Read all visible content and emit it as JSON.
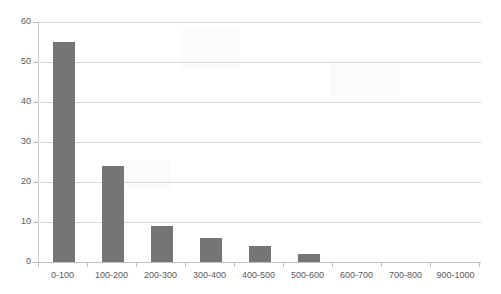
{
  "chart_data": {
    "type": "bar",
    "title": "",
    "subtitle": "",
    "xlabel": "",
    "ylabel": "",
    "categories": [
      "0-100",
      "100-200",
      "200-300",
      "300-400",
      "400-500",
      "500-600",
      "600-700",
      "700-800",
      "900-1000"
    ],
    "values": [
      55,
      24,
      9,
      6,
      4,
      2,
      0,
      0,
      0
    ],
    "series": [
      {
        "name": "Frequency",
        "values": [
          55,
          24,
          9,
          6,
          4,
          2,
          0,
          0,
          0
        ]
      }
    ],
    "ylim": [
      0,
      60
    ],
    "yticks": [
      0,
      10,
      20,
      30,
      40,
      50,
      60
    ],
    "ytick_labels": [
      "0",
      "10",
      "20",
      "30",
      "40",
      "50",
      "60"
    ],
    "grid": true,
    "grid_axis": "y",
    "legend": false,
    "legend_position": "none",
    "bar_color": "#757575",
    "gridline_color": "#d9d9d9",
    "axis_color": "#c8c8c8",
    "tick_label_color": "#595959",
    "background_color": "#ffffff"
  }
}
